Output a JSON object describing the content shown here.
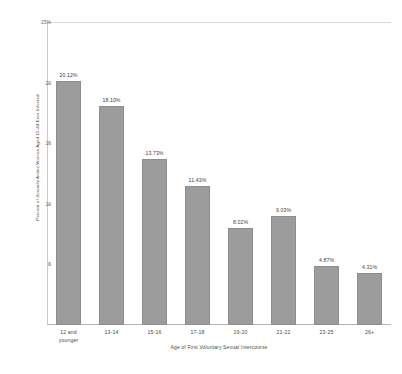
{
  "chart_data": {
    "type": "bar",
    "title": "",
    "xlabel": "Age of First Voluntary Sexual Intercourse",
    "ylabel": "Percent of Sexually Active Women Aged 15-44 Ever Infected",
    "categories": [
      "12 and\nyounger",
      "13-14",
      "15-16",
      "17-18",
      "19-20",
      "21-22",
      "23-25",
      "26+"
    ],
    "values": [
      20.12,
      18.1,
      13.73,
      11.43,
      8.02,
      9.03,
      4.87,
      4.31
    ],
    "data_labels": [
      "20.12%",
      "18.10%",
      "13.73%",
      "11.43%",
      "8.02%",
      "9.03%",
      "4.87%",
      "4.31%"
    ],
    "ylim": [
      0,
      25
    ],
    "yticks": [
      5,
      10,
      15,
      20,
      25
    ],
    "ytick_labels": [
      "5",
      "10",
      "15",
      "20",
      "25%"
    ],
    "grid": false,
    "legend": null,
    "bar_color": "#9c9c9c",
    "bar_edge_color": "#8e8e8e"
  }
}
